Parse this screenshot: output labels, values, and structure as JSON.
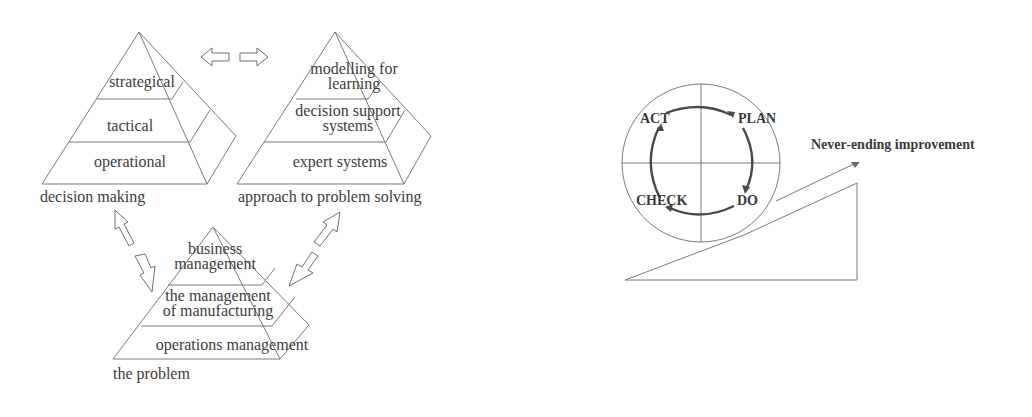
{
  "figure_left": {
    "pyramid_decision": {
      "levels": [
        "strategical",
        "tactical",
        "operational"
      ],
      "caption": "decision making"
    },
    "pyramid_approach": {
      "levels": [
        "modelling for learning",
        "decision support systems",
        "expert systems"
      ],
      "level_lines": {
        "top_1": "modelling for",
        "top_2": "learning",
        "mid_1": "decision support",
        "mid_2": "systems",
        "bottom": "expert systems"
      },
      "caption": "approach to problem solving"
    },
    "pyramid_problem": {
      "levels": [
        "business management",
        "the management of manufacturing",
        "operations management"
      ],
      "level_lines": {
        "top_1": "business",
        "top_2": "management",
        "mid_1": "the management",
        "mid_2": "of manufacturing",
        "bottom": "operations management"
      },
      "caption": "the problem"
    },
    "arrows": [
      {
        "name": "left-right-double-arrow",
        "between": [
          "decision making",
          "approach to problem solving"
        ]
      },
      {
        "name": "diagonal-double-arrow-left",
        "between": [
          "decision making",
          "the problem"
        ]
      },
      {
        "name": "diagonal-double-arrow-right",
        "between": [
          "approach to problem solving",
          "the problem"
        ]
      }
    ]
  },
  "figure_right": {
    "cycle": {
      "act": "ACT",
      "plan": "PLAN",
      "do": "DO",
      "check": "CHECK"
    },
    "slope_label": "Never-ending improvement"
  },
  "colors": {
    "line": "#6e6e6e",
    "text": "#3d3d3d",
    "background": "#ffffff"
  }
}
